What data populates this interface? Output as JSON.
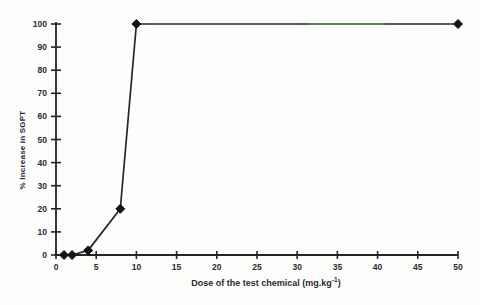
{
  "chart_data": {
    "type": "line",
    "title": "",
    "xlabel": "Dose of the test chemical (mg.kg⁻¹)",
    "xlabel_prefix": "Dose of the test chemical (mg.kg",
    "xlabel_sup": "-1",
    "xlabel_suffix": ")",
    "ylabel": "% Increase in SGPT",
    "series": [
      {
        "name": "SGPT increase",
        "x": [
          1,
          2,
          4,
          8,
          10,
          50
        ],
        "y": [
          0,
          0,
          2,
          20,
          100,
          100
        ]
      }
    ],
    "xlim": [
      0,
      50
    ],
    "ylim": [
      0,
      100
    ],
    "xticks": [
      0,
      5,
      10,
      15,
      20,
      25,
      30,
      35,
      40,
      45,
      50
    ],
    "yticks": [
      0,
      10,
      20,
      30,
      40,
      50,
      60,
      70,
      80,
      90,
      100
    ],
    "grid": false,
    "legend": null,
    "marker": "diamond",
    "colors": {
      "axis": "#26242a",
      "line": "#26242a",
      "marker": "#141317",
      "tick_label": "#2b2b31",
      "background": "#fdfdfc",
      "scan_artifact_green": "#5cc05c",
      "scan_artifact_purple": "#8a6aa0"
    }
  }
}
